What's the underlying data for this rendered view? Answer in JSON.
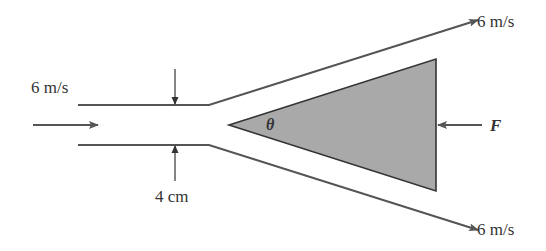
{
  "diagram": {
    "inlet_velocity_label": "6 m/s",
    "pipe_diameter_label": "4 cm",
    "upper_outlet_velocity_label": "6 m/s",
    "lower_outlet_velocity_label": "6 m/s",
    "angle_label": "θ",
    "force_label": "F"
  },
  "colors": {
    "line": "#555555",
    "wedge_fill": "#a9a9a9",
    "text": "#333333"
  }
}
